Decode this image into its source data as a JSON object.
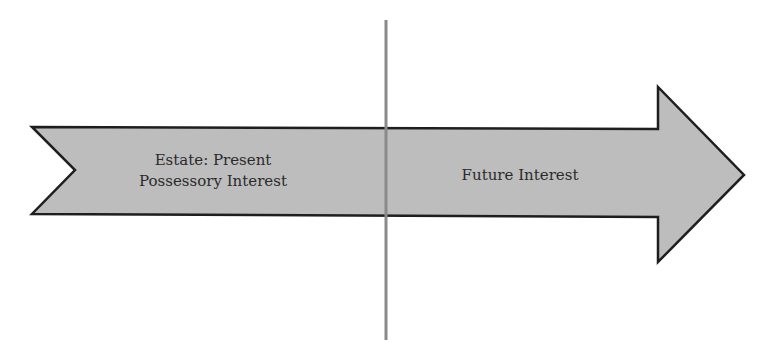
{
  "diagram": {
    "labels": {
      "estate_line1": "Estate:  Present",
      "estate_line2": "Possessory Interest",
      "future": "Future Interest"
    },
    "colors": {
      "arrow_fill": "#bdbdbd",
      "arrow_stroke": "#1e1e1e",
      "divider": "#8a8a8a",
      "background": "#ffffff",
      "text": "#2a2a2a"
    }
  }
}
